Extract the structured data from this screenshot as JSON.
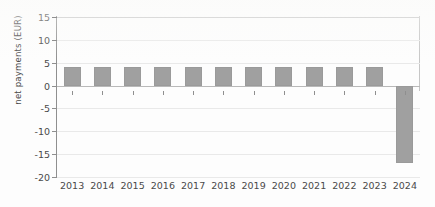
{
  "chart_data": {
    "type": "bar",
    "title": "",
    "subtitle": "",
    "xlabel": "",
    "ylabel": "net payments (EUR)",
    "categories": [
      "2013",
      "2014",
      "2015",
      "2016",
      "2017",
      "2018",
      "2019",
      "2020",
      "2021",
      "2022",
      "2023",
      "2024"
    ],
    "values": [
      4,
      4,
      4,
      4,
      4,
      4,
      4,
      4,
      4,
      4,
      4,
      -17
    ],
    "ylim": [
      -20,
      15
    ],
    "yticks": [
      15,
      10,
      5,
      0,
      -5,
      -10,
      -15,
      -20
    ],
    "ytick_labels": [
      "15",
      "10",
      "5",
      "0",
      "-5",
      "-10",
      "-15",
      "-20"
    ],
    "grid": true,
    "legend": false,
    "legend_position": "none",
    "series": [
      {
        "name": "net payments",
        "values": [
          4,
          4,
          4,
          4,
          4,
          4,
          4,
          4,
          4,
          4,
          4,
          -17
        ]
      }
    ],
    "colors": {
      "bar": "#a0a0a0",
      "grid": "#e9e9e9",
      "zero_line": "#b9b9b9",
      "axis": "#8f8f8f",
      "text": "#4a4a4a",
      "background": "#fdfdfd"
    }
  }
}
